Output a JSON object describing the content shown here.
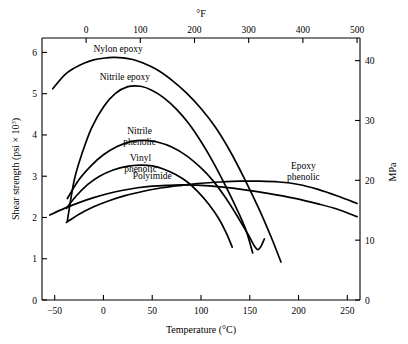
{
  "chart_data": {
    "type": "line",
    "title": "",
    "xlabel": "Temperature (°C)",
    "ylabel": "Shear strength (psi × 10",
    "ylabel_exp": "3",
    "ylabel_tail": ")",
    "xlabel_top": "°F",
    "ylabel_right": "MPa",
    "xlim": [
      -63,
      263
    ],
    "ylim": [
      0,
      6.35
    ],
    "xticks": [
      -50,
      0,
      50,
      100,
      150,
      200,
      250
    ],
    "xtick_labels": [
      "−50",
      "0",
      "50",
      "100",
      "150",
      "200",
      "250"
    ],
    "yticks": [
      0,
      1,
      2,
      3,
      4,
      5,
      6
    ],
    "ytick_labels": [
      "0",
      "1",
      "2",
      "3",
      "4",
      "5",
      "6"
    ],
    "xticks_top_f": [
      -100,
      0,
      100,
      200,
      300,
      400,
      500
    ],
    "xtick_top_labels": [
      "−100",
      "0",
      "100",
      "200",
      "300",
      "400",
      "500"
    ],
    "yticks_right_mpa": [
      0,
      10,
      20,
      30,
      40
    ],
    "ytick_right_labels": [
      "0",
      "10",
      "20",
      "30",
      "40"
    ],
    "grid": false,
    "legend_position": "inline-annotations",
    "series": [
      {
        "name": "Nylon epoxy",
        "label": "Nylon epoxy",
        "label_x": 15,
        "label_y": 6.02,
        "points": [
          [
            -52,
            5.12
          ],
          [
            -40,
            5.45
          ],
          [
            -30,
            5.62
          ],
          [
            -20,
            5.74
          ],
          [
            -10,
            5.82
          ],
          [
            0,
            5.86
          ],
          [
            10,
            5.88
          ],
          [
            20,
            5.87
          ],
          [
            30,
            5.83
          ],
          [
            40,
            5.75
          ],
          [
            55,
            5.58
          ],
          [
            70,
            5.33
          ],
          [
            85,
            5.02
          ],
          [
            100,
            4.64
          ],
          [
            115,
            4.18
          ],
          [
            130,
            3.6
          ],
          [
            145,
            2.92
          ],
          [
            160,
            2.18
          ],
          [
            172,
            1.52
          ],
          [
            182,
            0.92
          ]
        ]
      },
      {
        "name": "Nitrile epoxy",
        "label": "Nitrile epoxy",
        "label_x": 22,
        "label_y": 5.32,
        "points": [
          [
            -37,
            1.92
          ],
          [
            -30,
            2.9
          ],
          [
            -22,
            3.55
          ],
          [
            -12,
            4.18
          ],
          [
            0,
            4.68
          ],
          [
            12,
            5.0
          ],
          [
            25,
            5.17
          ],
          [
            38,
            5.18
          ],
          [
            50,
            5.08
          ],
          [
            62,
            4.9
          ],
          [
            75,
            4.62
          ],
          [
            88,
            4.26
          ],
          [
            100,
            3.84
          ],
          [
            112,
            3.36
          ],
          [
            124,
            2.82
          ],
          [
            136,
            2.24
          ],
          [
            146,
            1.7
          ],
          [
            153,
            1.14
          ]
        ]
      },
      {
        "name": "Nitrile phenolic",
        "label_line1": "Nitrile",
        "label_line2": "phenolic",
        "label_x": 37,
        "label_y": 4.02,
        "points": [
          [
            -37,
            2.46
          ],
          [
            -25,
            2.92
          ],
          [
            -12,
            3.27
          ],
          [
            0,
            3.52
          ],
          [
            14,
            3.72
          ],
          [
            28,
            3.84
          ],
          [
            42,
            3.87
          ],
          [
            55,
            3.83
          ],
          [
            70,
            3.71
          ],
          [
            85,
            3.5
          ],
          [
            100,
            3.2
          ],
          [
            112,
            2.9
          ],
          [
            124,
            2.52
          ],
          [
            136,
            2.08
          ],
          [
            148,
            1.6
          ],
          [
            158,
            1.22
          ],
          [
            165,
            1.48
          ]
        ]
      },
      {
        "name": "Vinyl phenolic",
        "label_line1": "Vinyl",
        "label_line2": "phenolic",
        "label_x": 38,
        "label_y": 3.36,
        "points": [
          [
            -38,
            2.22
          ],
          [
            -28,
            2.52
          ],
          [
            -16,
            2.8
          ],
          [
            -4,
            3.0
          ],
          [
            10,
            3.15
          ],
          [
            24,
            3.24
          ],
          [
            38,
            3.27
          ],
          [
            50,
            3.25
          ],
          [
            62,
            3.17
          ],
          [
            74,
            3.04
          ],
          [
            86,
            2.86
          ],
          [
            97,
            2.62
          ],
          [
            108,
            2.32
          ],
          [
            118,
            1.98
          ],
          [
            126,
            1.62
          ],
          [
            132,
            1.28
          ]
        ]
      },
      {
        "name": "Polyimide",
        "label": "Polyimide",
        "label_x": 50,
        "label_y": 2.94,
        "points": [
          [
            -55,
            2.06
          ],
          [
            -40,
            2.22
          ],
          [
            -25,
            2.36
          ],
          [
            -10,
            2.48
          ],
          [
            5,
            2.58
          ],
          [
            20,
            2.66
          ],
          [
            35,
            2.72
          ],
          [
            50,
            2.76
          ],
          [
            65,
            2.78
          ],
          [
            80,
            2.79
          ],
          [
            100,
            2.78
          ],
          [
            120,
            2.74
          ],
          [
            145,
            2.67
          ],
          [
            170,
            2.58
          ],
          [
            195,
            2.47
          ],
          [
            220,
            2.33
          ],
          [
            240,
            2.2
          ],
          [
            260,
            2.02
          ]
        ]
      },
      {
        "name": "Epoxy phenolic",
        "label_line1": "Epoxy",
        "label_line2": "phenolic",
        "label_x": 205,
        "label_y": 3.18,
        "points": [
          [
            -38,
            1.88
          ],
          [
            -25,
            2.08
          ],
          [
            -10,
            2.26
          ],
          [
            5,
            2.4
          ],
          [
            22,
            2.53
          ],
          [
            40,
            2.63
          ],
          [
            60,
            2.72
          ],
          [
            80,
            2.78
          ],
          [
            100,
            2.83
          ],
          [
            120,
            2.86
          ],
          [
            140,
            2.88
          ],
          [
            160,
            2.88
          ],
          [
            180,
            2.86
          ],
          [
            200,
            2.8
          ],
          [
            220,
            2.68
          ],
          [
            240,
            2.52
          ],
          [
            260,
            2.34
          ]
        ]
      }
    ]
  },
  "axes": {
    "bottom_title": "Temperature (°C)",
    "top_title": "°F",
    "right_title": "MPa",
    "left_title_main": "Shear strength (psi × 10",
    "left_title_sup": "3",
    "left_title_end": ")"
  }
}
